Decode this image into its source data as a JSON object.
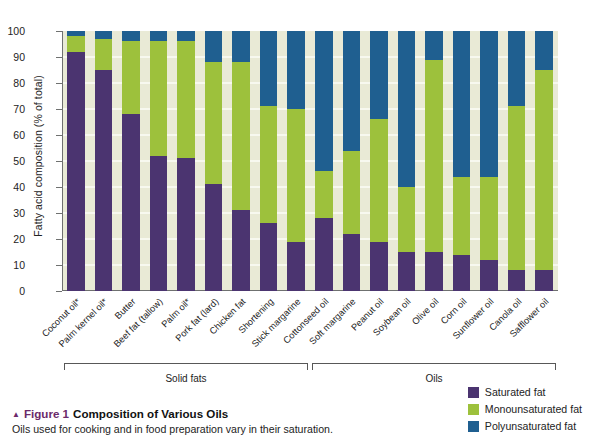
{
  "figure": {
    "triangle_glyph": "▲",
    "label": "Figure 1",
    "title": "Composition of Various Oils",
    "subtitle": "Oils used for cooking and in food preparation vary in their saturation."
  },
  "legend": {
    "position": "bottom-right",
    "items": [
      {
        "label": "Saturated fat",
        "color": "#4b3470"
      },
      {
        "label": "Monounsaturated fat",
        "color": "#9dc13c"
      },
      {
        "label": "Polyunsaturated fat",
        "color": "#1f5f90"
      }
    ]
  },
  "groups": [
    {
      "label": "Solid fats",
      "start_index": 0,
      "end_index": 8
    },
    {
      "label": "Oils",
      "start_index": 9,
      "end_index": 17
    }
  ],
  "colors": {
    "saturated": "#4b3470",
    "monounsaturated": "#9dc13c",
    "polyunsaturated": "#1f5f90",
    "plot_background": "#e9ead6",
    "gridline": "#f7f8ef",
    "axis": "#6f7170",
    "accent": "#6c2a6a"
  },
  "chart_data": {
    "type": "bar",
    "stacked": true,
    "title": "Composition of Various Oils",
    "xlabel": "",
    "ylabel": "Fatty acid composition (% of total)",
    "ylim": [
      0,
      100
    ],
    "yticks": [
      0,
      10,
      20,
      30,
      40,
      50,
      60,
      70,
      80,
      90,
      100
    ],
    "grid": true,
    "legend_position": "bottom-right",
    "categories": [
      "Coconut oil*",
      "Palm kernel oil*",
      "Butter",
      "Beef fat (tallow)",
      "Palm oil*",
      "Pork fat (lard)",
      "Chicken fat",
      "Shortening",
      "Stick margarine",
      "Cottonseed oil",
      "Soft margarine",
      "Peanut oil",
      "Soybean oil",
      "Olive oil",
      "Corn oil",
      "Sunflower oil",
      "Canola oil",
      "Safflower oil"
    ],
    "series": [
      {
        "name": "Saturated fat",
        "color": "#4b3470",
        "values": [
          92,
          85,
          68,
          52,
          51,
          41,
          31,
          26,
          19,
          28,
          22,
          19,
          15,
          15,
          14,
          12,
          8,
          8
        ]
      },
      {
        "name": "Monounsaturated fat",
        "color": "#9dc13c",
        "values": [
          6,
          12,
          28,
          44,
          45,
          47,
          57,
          45,
          51,
          18,
          32,
          47,
          25,
          74,
          30,
          32,
          63,
          77
        ]
      },
      {
        "name": "Polyunsaturated fat",
        "color": "#1f5f90",
        "values": [
          2,
          3,
          4,
          4,
          4,
          12,
          12,
          29,
          30,
          54,
          46,
          34,
          60,
          11,
          56,
          56,
          29,
          15
        ]
      }
    ],
    "footnote_marker": "*"
  }
}
